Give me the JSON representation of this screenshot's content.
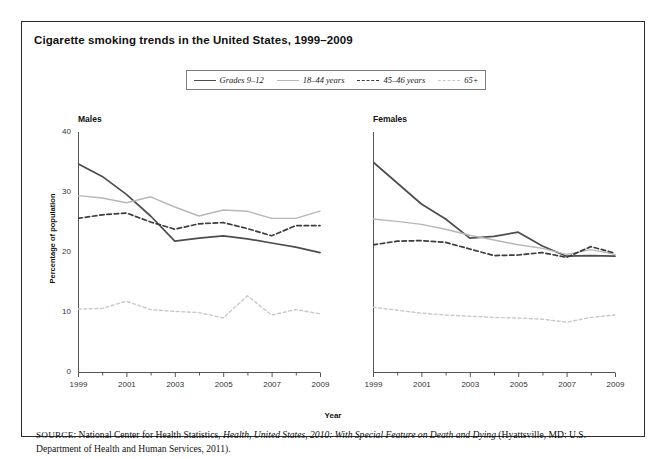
{
  "figure": {
    "title": "Cigarette smoking trends in the United States, 1999–2009",
    "xlabel": "Year",
    "ylabel": "Percentage of population",
    "panels": [
      {
        "name": "males",
        "title": "Males"
      },
      {
        "name": "females",
        "title": "Females"
      }
    ],
    "legend": [
      {
        "label": "Grades 9–12",
        "style": "solid",
        "color": "#4d4d4d"
      },
      {
        "label": "18–44 years",
        "style": "solid",
        "color": "#b7b7b7"
      },
      {
        "label": "45–46 years",
        "style": "dashed",
        "color": "#3d3d3d"
      },
      {
        "label": "65+",
        "style": "dashed",
        "color": "#c9c9c9"
      }
    ],
    "source": {
      "prefix": "SOURCE",
      "text_before_italic": ": National Center for Health Statistics, ",
      "italic_title": "Health, United States, 2010: With Special Feature on Death and Dying",
      "text_after_italic": " (Hyattsville, MD: U.S. Department of Health and Human Services, 2011)."
    }
  },
  "chart_data": {
    "type": "line",
    "title": "Cigarette smoking trends in the United States, 1999–2009",
    "xlabel": "Year",
    "ylabel": "Percentage of population",
    "xlim": [
      1999,
      2009
    ],
    "ylim": [
      0,
      40
    ],
    "yticks": [
      0,
      10,
      20,
      30,
      40
    ],
    "ytick_labels": [
      "0",
      "10",
      "20",
      "30",
      "40"
    ],
    "xticks": [
      1999,
      2000,
      2001,
      2002,
      2003,
      2004,
      2005,
      2006,
      2007,
      2008,
      2009
    ],
    "xtick_labels": [
      "1999",
      "",
      "2001",
      "",
      "2003",
      "",
      "2005",
      "",
      "2007",
      "",
      "2009"
    ],
    "grid": false,
    "legend_position": "top-center",
    "panels": [
      {
        "name": "Males",
        "x": [
          1999,
          2000,
          2001,
          2002,
          2003,
          2004,
          2005,
          2006,
          2007,
          2008,
          2009
        ],
        "series": [
          {
            "name": "Grades 9–12",
            "style": "solid",
            "color": "#4d4d4d",
            "values": [
              34.7,
              32.6,
              29.6,
              26.0,
              21.8,
              22.3,
              22.7,
              22.2,
              21.5,
              20.8,
              19.9
            ]
          },
          {
            "name": "18–44 years",
            "style": "solid",
            "color": "#b7b7b7",
            "values": [
              29.4,
              29.0,
              28.2,
              29.2,
              27.5,
              26.0,
              27.0,
              26.8,
              25.6,
              25.6,
              26.8
            ]
          },
          {
            "name": "45–46 years",
            "style": "dashed",
            "color": "#3d3d3d",
            "values": [
              25.6,
              26.2,
              26.5,
              25.0,
              23.8,
              24.7,
              24.9,
              23.9,
              22.7,
              24.4,
              24.4
            ]
          },
          {
            "name": "65+",
            "style": "dashed",
            "color": "#c9c9c9",
            "values": [
              10.5,
              10.6,
              11.8,
              10.4,
              10.1,
              9.9,
              9.0,
              12.7,
              9.5,
              10.4,
              9.7
            ]
          }
        ]
      },
      {
        "name": "Females",
        "x": [
          1999,
          2000,
          2001,
          2002,
          2003,
          2004,
          2005,
          2006,
          2007,
          2008,
          2009
        ],
        "series": [
          {
            "name": "Grades 9–12",
            "style": "solid",
            "color": "#4d4d4d",
            "values": [
              35.0,
              31.5,
              28.0,
              25.5,
              22.3,
              22.6,
              23.3,
              21.0,
              19.3,
              19.4,
              19.3
            ]
          },
          {
            "name": "18–44 years",
            "style": "solid",
            "color": "#b7b7b7",
            "values": [
              25.5,
              25.1,
              24.6,
              23.8,
              22.8,
              22.0,
              21.2,
              20.6,
              19.6,
              20.4,
              19.6
            ]
          },
          {
            "name": "45–46 years",
            "style": "dashed",
            "color": "#3d3d3d",
            "values": [
              21.2,
              21.8,
              21.9,
              21.6,
              20.5,
              19.4,
              19.5,
              19.9,
              19.1,
              20.9,
              19.8
            ]
          },
          {
            "name": "65+",
            "style": "dashed",
            "color": "#c9c9c9",
            "values": [
              10.8,
              10.3,
              9.8,
              9.5,
              9.3,
              9.1,
              9.0,
              8.8,
              8.3,
              9.1,
              9.5
            ]
          }
        ]
      }
    ]
  }
}
